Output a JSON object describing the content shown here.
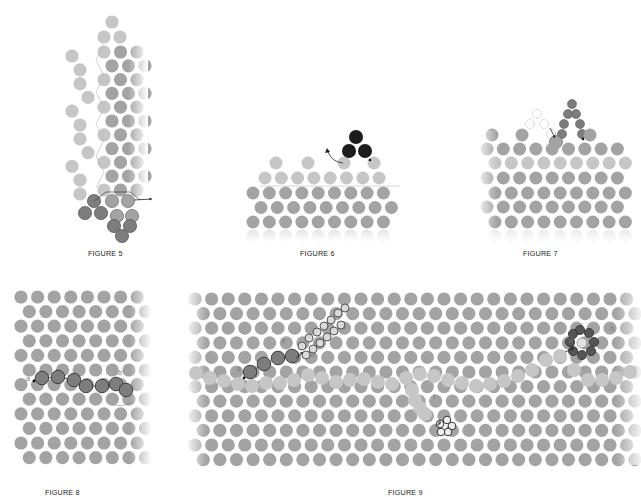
{
  "colors": {
    "lattice": "#a3a3a3",
    "lattice_light": "#c6c6c6",
    "dark_chain": "#7d7d7d",
    "black": "#1c1c1c",
    "outline": "#555555",
    "bond": "#bdbdbd",
    "caption": "#222222"
  },
  "figures": [
    {
      "id": "fig5",
      "caption": "FIGURE 5",
      "caption_pos": [
        88,
        249
      ],
      "description": "Stacked double-helix lattice column with a dark attached strand at the bottom and an outgoing arrow"
    },
    {
      "id": "fig6",
      "caption": "FIGURE 6",
      "caption_pos": [
        300,
        249
      ],
      "description": "Layered lattice surface with light peaks; black triad detaching with curved arrow"
    },
    {
      "id": "fig7",
      "caption": "FIGURE 7",
      "caption_pos": [
        523,
        249
      ],
      "description": "Layered lattice with dashed vacant sites and a dark chain forming a peak"
    },
    {
      "id": "fig8",
      "caption": "FIGURE 8",
      "caption_pos": [
        45,
        488
      ],
      "description": "Hexagonal lattice with dark outlined chain defect, endpoints a and b",
      "labels": [
        {
          "text": "a",
          "x": 26,
          "y": 381
        },
        {
          "text": "b",
          "x": 118,
          "y": 375
        }
      ]
    },
    {
      "id": "fig9",
      "caption": "FIGURE 9",
      "caption_pos": [
        388,
        488
      ],
      "description": "Large hexagonal lattice with a light wavy grain boundary, a dark chain with open-ring branch, a dark hexagonal ring cluster and a small open-ring cluster",
      "labels": [
        {
          "text": "a",
          "x": 237,
          "y": 371
        },
        {
          "text": "b",
          "x": 296,
          "y": 362
        },
        {
          "text": "c",
          "x": 343,
          "y": 329
        },
        {
          "text": "d",
          "x": 311,
          "y": 357
        },
        {
          "text": "e",
          "x": 282,
          "y": 343
        },
        {
          "text": "f",
          "x": 433,
          "y": 399
        },
        {
          "text": "g",
          "x": 436,
          "y": 425
        },
        {
          "text": "h",
          "x": 610,
          "y": 331
        },
        {
          "text": "i",
          "x": 577,
          "y": 360
        },
        {
          "text": "g",
          "x": 569,
          "y": 341
        }
      ]
    }
  ],
  "lattices": {
    "fig8": {
      "x0": 21,
      "y0": 297,
      "dx": 16.6,
      "dy": 14.6,
      "rows": 12,
      "cols": 8,
      "r": 6.6
    },
    "fig9": {
      "x0": 195,
      "y0": 299,
      "dx": 16.6,
      "dy": 14.6,
      "rows": 12,
      "cols": 27,
      "r": 6.6
    }
  },
  "chains": {
    "fig8_chain": [
      [
        42,
        378
      ],
      [
        58,
        377
      ],
      [
        74,
        380
      ],
      [
        86,
        386
      ],
      [
        102,
        386
      ],
      [
        116,
        384
      ],
      [
        126,
        390
      ]
    ],
    "fig9_dark_chain": [
      [
        250,
        372
      ],
      [
        264,
        364
      ],
      [
        278,
        358
      ],
      [
        292,
        356
      ]
    ],
    "fig9_open_upper": [
      [
        302,
        346
      ],
      [
        309,
        338
      ],
      [
        317,
        332
      ],
      [
        324,
        326
      ],
      [
        331,
        320
      ],
      [
        338,
        313
      ],
      [
        345,
        308
      ]
    ],
    "fig9_open_lower": [
      [
        306,
        355
      ],
      [
        313,
        349
      ],
      [
        320,
        343
      ],
      [
        327,
        337
      ],
      [
        334,
        331
      ],
      [
        341,
        325
      ]
    ],
    "fig9_boundary": [
      [
        196,
        373
      ],
      [
        210,
        378
      ],
      [
        224,
        381
      ],
      [
        238,
        384
      ],
      [
        252,
        386
      ],
      [
        266,
        383
      ],
      [
        280,
        383
      ],
      [
        294,
        380
      ],
      [
        308,
        375
      ],
      [
        322,
        378
      ],
      [
        336,
        382
      ],
      [
        350,
        380
      ],
      [
        364,
        379
      ],
      [
        378,
        382
      ],
      [
        392,
        384
      ],
      [
        406,
        378
      ],
      [
        420,
        374
      ],
      [
        434,
        376
      ],
      [
        448,
        380
      ],
      [
        462,
        383
      ],
      [
        476,
        386
      ],
      [
        490,
        384
      ],
      [
        504,
        381
      ],
      [
        518,
        376
      ],
      [
        532,
        370
      ],
      [
        546,
        360
      ],
      [
        560,
        356
      ],
      [
        574,
        370
      ],
      [
        588,
        380
      ],
      [
        602,
        380
      ],
      [
        616,
        378
      ],
      [
        630,
        372
      ]
    ],
    "fig9_boundary_lower": [
      [
        412,
        390
      ],
      [
        415,
        400
      ],
      [
        420,
        408
      ],
      [
        425,
        414
      ]
    ],
    "fig9_ring": [
      [
        580,
        330
      ],
      [
        589,
        333
      ],
      [
        594,
        342
      ],
      [
        591,
        351
      ],
      [
        582,
        355
      ],
      [
        573,
        351
      ],
      [
        570,
        342
      ],
      [
        573,
        334
      ]
    ],
    "fig9_ring_center": [
      582,
      343
    ],
    "fig9_small_ring": [
      [
        440,
        424
      ],
      [
        447,
        420
      ],
      [
        452,
        426
      ],
      [
        448,
        432
      ],
      [
        441,
        432
      ]
    ]
  }
}
